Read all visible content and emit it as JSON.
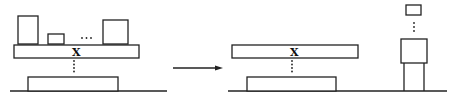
{
  "diagram": {
    "type": "before-after transformation",
    "left_panel": {
      "label": "X",
      "ellipsis": "...",
      "items_on_platform": 3
    },
    "arrow": {
      "direction": "right"
    },
    "right_panel": {
      "label": "X"
    },
    "colors": {
      "stroke": "#222222",
      "background": "#ffffff"
    }
  }
}
